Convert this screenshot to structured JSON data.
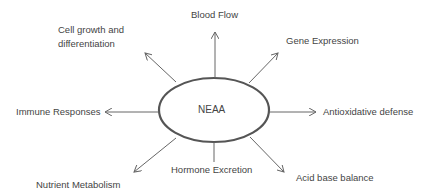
{
  "center": {
    "label": "NEAA"
  },
  "outputs": [
    {
      "id": "blood-flow",
      "label": "Blood Flow"
    },
    {
      "id": "gene-expression",
      "label": "Gene Expression"
    },
    {
      "id": "antioxidative-defense",
      "label": "Antioxidative defense"
    },
    {
      "id": "acid-base-balance",
      "label": "Acid base balance"
    },
    {
      "id": "hormone-excretion",
      "label": "Hormone Excretion"
    },
    {
      "id": "nutrient-metabolism",
      "label": "Nutrient Metabolism"
    },
    {
      "id": "immune-responses",
      "label": "Immune Responses"
    },
    {
      "id": "cell-growth",
      "label_line1": "Cell growth and",
      "label_line2": "differentiation"
    }
  ],
  "colors": {
    "ellipse_stroke": "#555555",
    "arrow": "#666666",
    "text": "#444444"
  }
}
